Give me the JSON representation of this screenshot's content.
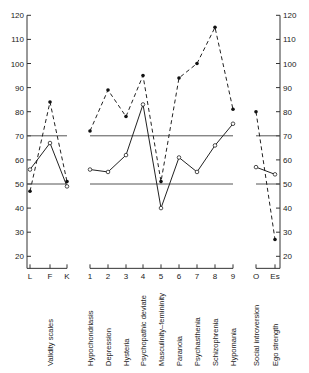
{
  "chart_data": {
    "type": "line",
    "title": "",
    "xlabel": "",
    "ylabel": "",
    "ylim": [
      15,
      120
    ],
    "yticks": [
      20,
      30,
      40,
      50,
      60,
      70,
      80,
      90,
      100,
      110,
      120
    ],
    "reference_lines": [
      50,
      70
    ],
    "groups": [
      {
        "name": "Validity scales",
        "categories": [
          "L",
          "F",
          "K"
        ],
        "series": [
          {
            "name": "dashed",
            "style": "dashed",
            "marker": "filled",
            "values": [
              47,
              84,
              51
            ]
          },
          {
            "name": "solid",
            "style": "solid",
            "marker": "open",
            "values": [
              56,
              67,
              49
            ]
          }
        ]
      },
      {
        "name": "Clinical scales",
        "categories": [
          "1",
          "2",
          "3",
          "4",
          "5",
          "6",
          "7",
          "8",
          "9"
        ],
        "labels": [
          "Hypochondriasis",
          "Depression",
          "Hysteria",
          "Psychopathic deviate",
          "Masculinity–femininity",
          "Paranoia",
          "Psychasthenia",
          "Schizophrenia",
          "Hypomania"
        ],
        "series": [
          {
            "name": "dashed",
            "style": "dashed",
            "marker": "filled",
            "values": [
              72,
              89,
              78,
              95,
              51,
              94,
              100,
              115,
              81
            ]
          },
          {
            "name": "solid",
            "style": "solid",
            "marker": "open",
            "values": [
              56,
              55,
              62,
              83,
              40,
              61,
              55,
              66,
              75
            ]
          }
        ]
      },
      {
        "name": "Supplementary scales",
        "categories": [
          "O",
          "Es"
        ],
        "labels": [
          "Social introversion",
          "Ego strength"
        ],
        "series": [
          {
            "name": "dashed",
            "style": "dashed",
            "marker": "filled",
            "values": [
              80,
              27
            ]
          },
          {
            "name": "solid",
            "style": "solid",
            "marker": "open",
            "values": [
              57,
              54
            ]
          }
        ]
      }
    ]
  },
  "labels": {
    "validity": "Validity scales",
    "clinical": [
      "Hypochondriasis",
      "Depression",
      "Hysteria",
      "Psychopathic deviate",
      "Masculinity–femininity",
      "Paranoia",
      "Psychasthenia",
      "Schizophrenia",
      "Hypomania"
    ],
    "supplementary": [
      "Social introversion",
      "Ego strength"
    ]
  }
}
